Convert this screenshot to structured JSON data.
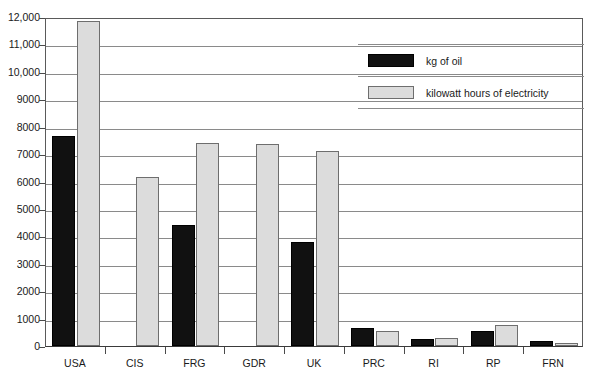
{
  "chart_data": {
    "type": "bar",
    "title": "",
    "subtitle": "",
    "xlabel": "",
    "ylabel": "",
    "categories": [
      "USA",
      "CIS",
      "FRG",
      "GDR",
      "UK",
      "PRC",
      "RI",
      "RP",
      "FRN"
    ],
    "series": [
      {
        "name": "kg of oil",
        "color": "#111111",
        "values": [
          7650,
          null,
          4400,
          null,
          3780,
          640,
          270,
          530,
          180
        ]
      },
      {
        "name": "kilowatt hours of electricity",
        "color": "#dcdcdc",
        "values": [
          11850,
          6150,
          7400,
          7380,
          7100,
          540,
          300,
          780,
          110
        ]
      }
    ],
    "ylim": [
      0,
      12000
    ],
    "ytick_step": 1000,
    "ytick_labels": [
      "0",
      "1000",
      "2000",
      "3000",
      "4000",
      "5000",
      "6000",
      "7000",
      "8000",
      "9000",
      "10,000",
      "11,000",
      "12,000"
    ],
    "ytick_values": [
      0,
      1000,
      2000,
      3000,
      4000,
      5000,
      6000,
      7000,
      8000,
      9000,
      10000,
      11000,
      12000
    ],
    "grid": true,
    "grid_axis": "y",
    "legend_position": "top-right",
    "legend_entries": [
      "kg of oil",
      "kilowatt hours of electricity"
    ]
  },
  "legend": {
    "oil_label": "kg of oil",
    "electricity_label": "kilowatt hours of electricity"
  }
}
